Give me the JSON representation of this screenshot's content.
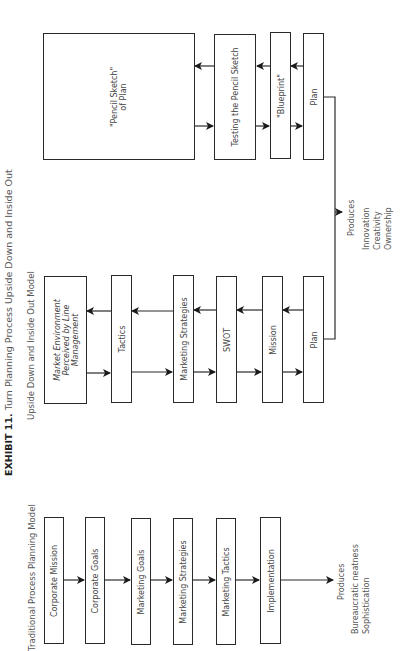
{
  "exhibit": {
    "label": "EXHIBIT 11.",
    "title": "Turn Planning Process Upside Down and Inside Out"
  },
  "upside_model": {
    "title": "Upside Down and Inside Out Model",
    "top_row": {
      "boxes": [
        {
          "label_line1": "\"Pencil Sketch\"",
          "label_line2": "of Plan"
        },
        {
          "label": "Testing the Pencil Sketch"
        },
        {
          "label": "\"Blueprint\""
        },
        {
          "label": "Plan"
        }
      ]
    },
    "middle_row": {
      "boxes": [
        {
          "label_line1": "Market Environment",
          "label_line2": "Perceived by Line",
          "label_line3": "Management"
        },
        {
          "label": "Tactics"
        },
        {
          "label": "Marketing Strategies"
        },
        {
          "label": "SWOT"
        },
        {
          "label": "Mission"
        },
        {
          "label": "Plan"
        }
      ]
    },
    "produces": {
      "label": "Produces",
      "items": [
        "Innovation",
        "Creativity",
        "Ownership"
      ]
    }
  },
  "traditional_model": {
    "title": "Traditional Process Planning Model",
    "boxes": [
      {
        "label": "Corporate Mission"
      },
      {
        "label": "Corporate Goals"
      },
      {
        "label": "Marketing Goals"
      },
      {
        "label": "Marketing Strategies"
      },
      {
        "label": "Marketing Tactics"
      },
      {
        "label": "Implementation"
      }
    ],
    "produces": {
      "label": "Produces",
      "items": [
        "Bureaucratic neatness",
        "Sophistication"
      ]
    }
  }
}
